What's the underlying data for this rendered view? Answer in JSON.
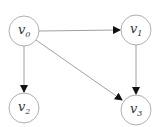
{
  "diagram": {
    "type": "directed-graph",
    "nodes": [
      {
        "id": "v0",
        "label": "v",
        "sub": "0",
        "cx": 24,
        "cy": 31
      },
      {
        "id": "v1",
        "label": "v",
        "sub": "1",
        "cx": 136,
        "cy": 30
      },
      {
        "id": "v2",
        "label": "v",
        "sub": "2",
        "cx": 24,
        "cy": 108
      },
      {
        "id": "v3",
        "label": "v",
        "sub": "3",
        "cx": 136,
        "cy": 110
      }
    ],
    "edges": [
      {
        "from": "v0",
        "to": "v1"
      },
      {
        "from": "v0",
        "to": "v2"
      },
      {
        "from": "v0",
        "to": "v3"
      },
      {
        "from": "v1",
        "to": "v3"
      }
    ],
    "colors": {
      "node_stroke": "#999999",
      "edge": "#888888",
      "arrow": "#111111"
    }
  }
}
